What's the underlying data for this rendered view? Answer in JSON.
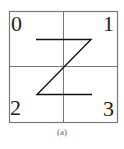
{
  "figure": {
    "caption": "(a)",
    "quadrants": [
      {
        "id": 0,
        "label": "0",
        "position": "top-left"
      },
      {
        "id": 1,
        "label": "1",
        "position": "top-right"
      },
      {
        "id": 2,
        "label": "2",
        "position": "bottom-left"
      },
      {
        "id": 3,
        "label": "3",
        "position": "bottom-right"
      }
    ],
    "curve": {
      "type": "z-order",
      "order": [
        "0",
        "1",
        "2",
        "3"
      ],
      "stroke_color": "#111111"
    },
    "grid": {
      "rows": 2,
      "cols": 2,
      "line_color": "#777777"
    }
  }
}
